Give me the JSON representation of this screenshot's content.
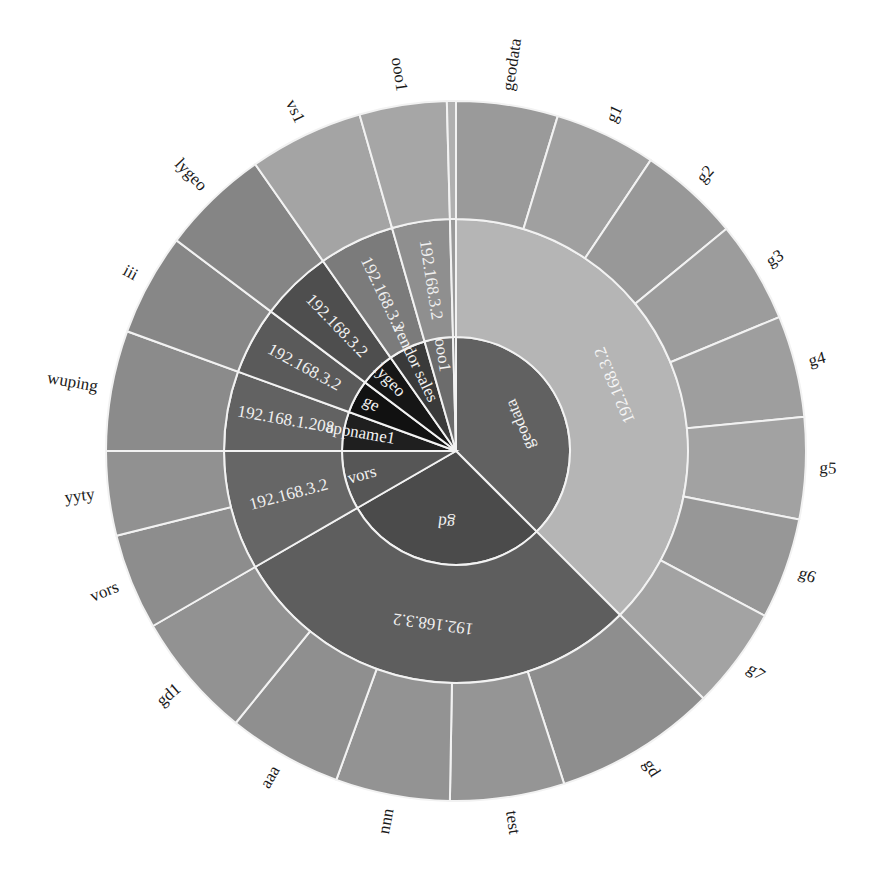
{
  "chart_data": {
    "type": "sunburst",
    "title": "",
    "center": {
      "x": 456,
      "y": 451
    },
    "radii": {
      "inner": 114,
      "middle": 232,
      "outer": 350
    },
    "start_angle_deg": 0,
    "direction": "clockwise from 12 o'clock",
    "levels": [
      {
        "name": "inner",
        "segments": [
          {
            "label": "geodata",
            "start": 0,
            "end": 135,
            "color": "#616161",
            "text_color": "#f2f2f2"
          },
          {
            "label": "gd",
            "start": 135,
            "end": 240,
            "color": "#4b4b4b",
            "text_color": "#f2f2f2"
          },
          {
            "label": "vors",
            "start": 240,
            "end": 270,
            "color": "#565656",
            "text_color": "#f2f2f2"
          },
          {
            "label": "appname1",
            "start": 270,
            "end": 290,
            "color": "#1f1f1f",
            "text_color": "#f2f2f2"
          },
          {
            "label": "ge",
            "start": 290,
            "end": 307,
            "color": "#111111",
            "text_color": "#f2f2f2"
          },
          {
            "label": "lygeo",
            "start": 307,
            "end": 325,
            "color": "#161616",
            "text_color": "#f2f2f2"
          },
          {
            "label": "vendor sales",
            "start": 325,
            "end": 344,
            "color": "#3a3a3a",
            "text_color": "#f2f2f2"
          },
          {
            "label": "ooo1",
            "start": 344,
            "end": 358.5,
            "color": "#6c6c6c",
            "text_color": "#f2f2f2"
          },
          {
            "label": "",
            "start": 358.5,
            "end": 360,
            "color": "#7a7a7a",
            "text_color": "#f2f2f2"
          }
        ]
      },
      {
        "name": "middle",
        "segments": [
          {
            "label": "192.168.3.2",
            "start": 0,
            "end": 135,
            "color": "#b5b5b5",
            "text_color": "#f5f5f5"
          },
          {
            "label": "192.168.3.2",
            "start": 135,
            "end": 240,
            "color": "#5e5e5e",
            "text_color": "#f0f0f0"
          },
          {
            "label": "192.168.3.2",
            "start": 240,
            "end": 270,
            "color": "#666666",
            "text_color": "#f0f0f0"
          },
          {
            "label": "192.168.1.208",
            "start": 270,
            "end": 290,
            "color": "#626262",
            "text_color": "#f0f0f0"
          },
          {
            "label": "192.168.3.2",
            "start": 290,
            "end": 307,
            "color": "#5a5a5a",
            "text_color": "#f0f0f0"
          },
          {
            "label": "192.168.3.2",
            "start": 307,
            "end": 325,
            "color": "#4e4e4e",
            "text_color": "#f0f0f0"
          },
          {
            "label": "192.168.3.2",
            "start": 325,
            "end": 344,
            "color": "#7b7b7b",
            "text_color": "#f0f0f0"
          },
          {
            "label": "192.168.3.2",
            "start": 344,
            "end": 358.5,
            "color": "#8f8f8f",
            "text_color": "#f0f0f0"
          },
          {
            "label": "",
            "start": 358.5,
            "end": 360,
            "color": "#9a9a9a",
            "text_color": "#f0f0f0"
          }
        ]
      },
      {
        "name": "outer",
        "segments": [
          {
            "label": "geodata",
            "start": 0,
            "end": 16.9,
            "color": "#9a9a9a"
          },
          {
            "label": "g1",
            "start": 16.9,
            "end": 33.8,
            "color": "#a0a0a0"
          },
          {
            "label": "g2",
            "start": 33.8,
            "end": 50.6,
            "color": "#989898"
          },
          {
            "label": "g3",
            "start": 50.6,
            "end": 67.5,
            "color": "#9c9c9c"
          },
          {
            "label": "g4",
            "start": 67.5,
            "end": 84.4,
            "color": "#9e9e9e"
          },
          {
            "label": "g5",
            "start": 84.4,
            "end": 101.3,
            "color": "#a2a2a2"
          },
          {
            "label": "g6",
            "start": 101.3,
            "end": 118.1,
            "color": "#979797"
          },
          {
            "label": "g7",
            "start": 118.1,
            "end": 135,
            "color": "#a3a3a3"
          },
          {
            "label": "gd",
            "start": 135,
            "end": 162,
            "color": "#8e8e8e"
          },
          {
            "label": "test",
            "start": 162,
            "end": 181,
            "color": "#959595"
          },
          {
            "label": "nnn",
            "start": 181,
            "end": 200,
            "color": "#939393"
          },
          {
            "label": "aaa",
            "start": 200,
            "end": 219,
            "color": "#8f8f8f"
          },
          {
            "label": "gd1",
            "start": 219,
            "end": 240,
            "color": "#929292"
          },
          {
            "label": "vors",
            "start": 240,
            "end": 256,
            "color": "#8d8d8d"
          },
          {
            "label": "yyty",
            "start": 256,
            "end": 270,
            "color": "#919191"
          },
          {
            "label": "wuping",
            "start": 270,
            "end": 290,
            "color": "#8b8b8b"
          },
          {
            "label": "iii",
            "start": 290,
            "end": 307,
            "color": "#878787"
          },
          {
            "label": "lygeo",
            "start": 307,
            "end": 325,
            "color": "#858585"
          },
          {
            "label": "vs1",
            "start": 325,
            "end": 344,
            "color": "#a4a4a4"
          },
          {
            "label": "ooo1",
            "start": 344,
            "end": 358.5,
            "color": "#a6a6a6"
          },
          {
            "label": "",
            "start": 358.5,
            "end": 360,
            "color": "#b0b0b0"
          }
        ]
      }
    ],
    "outer_label_color": "#1a1a1a",
    "separator_color": "#f2f2f2"
  }
}
